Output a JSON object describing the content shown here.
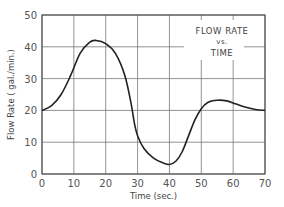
{
  "chart_data": {
    "type": "line",
    "title": "FLOW RATE vs. TIME",
    "title_lines": [
      "FLOW RATE",
      "vs.",
      "TIME"
    ],
    "xlabel": "Time (sec.)",
    "ylabel": "Flow Rate ( gal./min.)",
    "xlim": [
      0,
      70
    ],
    "ylim": [
      0,
      50
    ],
    "xticks": [
      0,
      10,
      20,
      30,
      40,
      50,
      60,
      70
    ],
    "yticks": [
      0,
      10,
      20,
      30,
      40,
      50
    ],
    "grid": true,
    "legend": null,
    "series": [
      {
        "name": "Flow Rate",
        "x": [
          0,
          3,
          6,
          9,
          12,
          15,
          17,
          20,
          23,
          26,
          28,
          29,
          30,
          32,
          35,
          38,
          40,
          42,
          44,
          46,
          48,
          50,
          52,
          55,
          58,
          61,
          64,
          67,
          70
        ],
        "y": [
          20,
          21.5,
          25,
          31,
          38,
          41.5,
          42,
          41,
          38,
          31,
          22,
          16,
          12,
          8,
          5,
          3.5,
          3,
          4,
          7,
          12,
          17,
          20.5,
          22.5,
          23.2,
          23,
          22,
          21,
          20.3,
          20
        ]
      }
    ]
  }
}
